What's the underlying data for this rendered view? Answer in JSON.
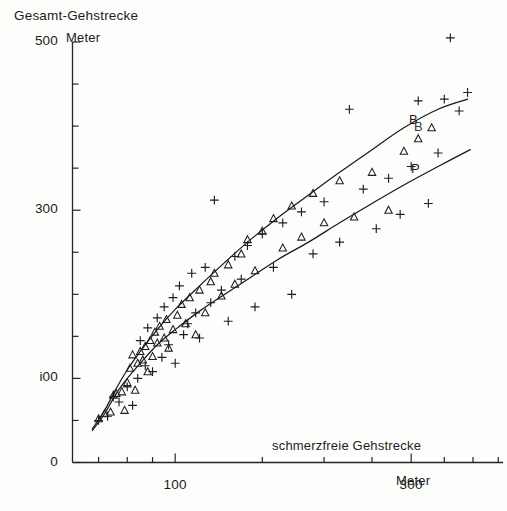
{
  "figure": {
    "title": "Gesamt-Gehstrecke",
    "y_unit": "Meter",
    "x_title": "schmerzfreie Gehstrecke",
    "x_unit": "Meter"
  },
  "axes": {
    "y_labels": [
      "500",
      "300",
      "i00",
      "0"
    ],
    "x_labels": [
      "100",
      "300"
    ]
  },
  "curve_labels": {
    "upper": "B",
    "upper_shadow": "B",
    "lower": "P"
  },
  "chart_data": {
    "type": "scatter",
    "title": "Gesamt-Gehstrecke",
    "xlabel": "schmerzfreie Gehstrecke (Meter)",
    "ylabel": "Gesamt-Gehstrecke (Meter)",
    "xscale": "log",
    "yscale": "linear",
    "xlim": [
      62,
      460
    ],
    "ylim": [
      0,
      500
    ],
    "grid": false,
    "legend": "none",
    "x_ticks_major": [
      100,
      300
    ],
    "x_ticks_minor": [
      70,
      80,
      90,
      100,
      150,
      200,
      250,
      300,
      350,
      400,
      450
    ],
    "y_ticks_major": [
      0,
      100,
      300,
      500
    ],
    "y_ticks_minor": [
      0,
      50,
      100,
      150,
      200,
      250,
      300,
      350,
      400,
      450,
      500
    ],
    "series": [
      {
        "name": "triangle-series",
        "marker": "triangle",
        "points": [
          [
            70,
            52
          ],
          [
            72,
            58
          ],
          [
            74,
            60
          ],
          [
            75,
            80
          ],
          [
            76,
            82
          ],
          [
            78,
            84
          ],
          [
            79,
            62
          ],
          [
            80,
            95
          ],
          [
            81,
            112
          ],
          [
            82,
            128
          ],
          [
            83,
            86
          ],
          [
            84,
            118
          ],
          [
            85,
            132
          ],
          [
            86,
            122
          ],
          [
            87,
            138
          ],
          [
            88,
            108
          ],
          [
            89,
            145
          ],
          [
            90,
            126
          ],
          [
            91,
            155
          ],
          [
            92,
            142
          ],
          [
            93,
            162
          ],
          [
            95,
            148
          ],
          [
            96,
            170
          ],
          [
            97,
            136
          ],
          [
            99,
            158
          ],
          [
            101,
            175
          ],
          [
            103,
            188
          ],
          [
            105,
            165
          ],
          [
            107,
            196
          ],
          [
            110,
            152
          ],
          [
            112,
            205
          ],
          [
            115,
            178
          ],
          [
            118,
            215
          ],
          [
            120,
            225
          ],
          [
            124,
            198
          ],
          [
            128,
            235
          ],
          [
            132,
            212
          ],
          [
            136,
            248
          ],
          [
            140,
            265
          ],
          [
            145,
            228
          ],
          [
            150,
            275
          ],
          [
            158,
            290
          ],
          [
            165,
            255
          ],
          [
            172,
            305
          ],
          [
            180,
            268
          ],
          [
            190,
            320
          ],
          [
            200,
            285
          ],
          [
            215,
            335
          ],
          [
            230,
            292
          ],
          [
            250,
            345
          ],
          [
            270,
            300
          ],
          [
            290,
            370
          ],
          [
            310,
            385
          ],
          [
            330,
            398
          ]
        ]
      },
      {
        "name": "plus-series",
        "marker": "plus",
        "points": [
          [
            70,
            50
          ],
          [
            73,
            55
          ],
          [
            75,
            78
          ],
          [
            77,
            72
          ],
          [
            80,
            90
          ],
          [
            82,
            68
          ],
          [
            84,
            100
          ],
          [
            85,
            145
          ],
          [
            87,
            115
          ],
          [
            88,
            160
          ],
          [
            90,
            108
          ],
          [
            92,
            172
          ],
          [
            94,
            125
          ],
          [
            95,
            185
          ],
          [
            97,
            140
          ],
          [
            99,
            196
          ],
          [
            100,
            118
          ],
          [
            102,
            210
          ],
          [
            104,
            152
          ],
          [
            106,
            165
          ],
          [
            108,
            225
          ],
          [
            110,
            178
          ],
          [
            112,
            148
          ],
          [
            115,
            232
          ],
          [
            118,
            190
          ],
          [
            120,
            312
          ],
          [
            124,
            205
          ],
          [
            128,
            168
          ],
          [
            132,
            245
          ],
          [
            136,
            218
          ],
          [
            140,
            258
          ],
          [
            145,
            185
          ],
          [
            150,
            272
          ],
          [
            158,
            232
          ],
          [
            165,
            285
          ],
          [
            172,
            200
          ],
          [
            180,
            298
          ],
          [
            190,
            248
          ],
          [
            200,
            310
          ],
          [
            215,
            262
          ],
          [
            225,
            420
          ],
          [
            240,
            325
          ],
          [
            255,
            278
          ],
          [
            270,
            338
          ],
          [
            285,
            295
          ],
          [
            300,
            352
          ],
          [
            310,
            430
          ],
          [
            325,
            308
          ],
          [
            340,
            368
          ],
          [
            350,
            432
          ],
          [
            360,
            505
          ],
          [
            375,
            418
          ],
          [
            390,
            440
          ]
        ]
      }
    ],
    "fitted_curves": [
      {
        "name": "B",
        "label": "B",
        "description": "upper regression curve",
        "points": [
          [
            68,
            40
          ],
          [
            72,
            62
          ],
          [
            76,
            88
          ],
          [
            80,
            110
          ],
          [
            85,
            132
          ],
          [
            92,
            158
          ],
          [
            100,
            182
          ],
          [
            112,
            210
          ],
          [
            126,
            238
          ],
          [
            142,
            265
          ],
          [
            162,
            292
          ],
          [
            186,
            318
          ],
          [
            215,
            345
          ],
          [
            250,
            372
          ],
          [
            290,
            398
          ],
          [
            340,
            420
          ],
          [
            390,
            432
          ]
        ]
      },
      {
        "name": "P",
        "label": "P",
        "description": "lower regression curve",
        "points": [
          [
            68,
            38
          ],
          [
            72,
            58
          ],
          [
            76,
            82
          ],
          [
            80,
            100
          ],
          [
            85,
            118
          ],
          [
            92,
            140
          ],
          [
            100,
            158
          ],
          [
            112,
            180
          ],
          [
            126,
            200
          ],
          [
            142,
            220
          ],
          [
            162,
            242
          ],
          [
            186,
            262
          ],
          [
            215,
            285
          ],
          [
            250,
            308
          ],
          [
            290,
            330
          ],
          [
            340,
            352
          ],
          [
            395,
            372
          ]
        ]
      }
    ]
  }
}
